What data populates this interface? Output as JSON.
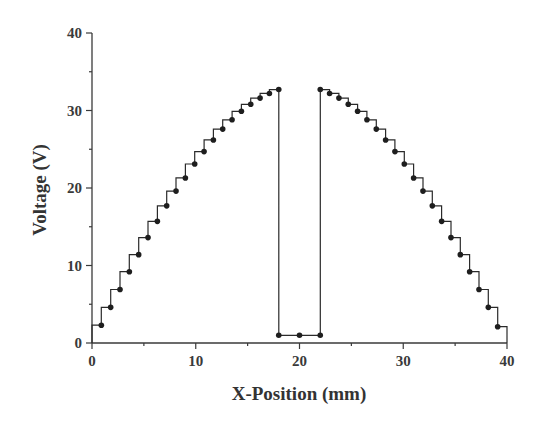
{
  "chart_data": {
    "type": "line",
    "style": "step with markers",
    "title": "",
    "xlabel": "X-Position (mm)",
    "ylabel": "Voltage (V)",
    "xlim": [
      0,
      40
    ],
    "ylim": [
      0,
      40
    ],
    "xticks": [
      0,
      10,
      20,
      30,
      40
    ],
    "yticks": [
      0,
      10,
      20,
      30,
      40
    ],
    "minor_tick_step": 5,
    "grid": false,
    "legend": null,
    "colors": {
      "line": "#2a2a2a",
      "marker": "#1e1e1e",
      "axis": "#3a3a3a"
    },
    "series": [
      {
        "name": "left segment",
        "step": "pre",
        "start": [
          0,
          2.3
        ],
        "x": [
          0.9,
          1.8,
          2.7,
          3.6,
          4.5,
          5.4,
          6.3,
          7.2,
          8.1,
          9.0,
          9.9,
          10.8,
          11.7,
          12.6,
          13.5,
          14.4,
          15.3,
          16.2,
          17.1,
          18.0
        ],
        "y": [
          2.3,
          4.6,
          6.9,
          9.2,
          11.4,
          13.6,
          15.7,
          17.7,
          19.6,
          21.3,
          23.1,
          24.7,
          26.2,
          27.6,
          28.8,
          29.9,
          30.8,
          31.6,
          32.2,
          32.7
        ]
      },
      {
        "name": "center gap",
        "step": "none",
        "x": [
          18.0,
          20.0,
          22.0
        ],
        "y": [
          1.0,
          1.0,
          1.0
        ]
      },
      {
        "name": "right segment",
        "step": "post",
        "end": [
          40,
          2.1
        ],
        "x": [
          22.0,
          22.9,
          23.8,
          24.7,
          25.6,
          26.5,
          27.4,
          28.3,
          29.2,
          30.1,
          31.0,
          31.9,
          32.8,
          33.7,
          34.6,
          35.5,
          36.4,
          37.3,
          38.2,
          39.1
        ],
        "y": [
          32.7,
          32.2,
          31.6,
          30.8,
          29.9,
          28.8,
          27.6,
          26.2,
          24.7,
          23.1,
          21.3,
          19.6,
          17.7,
          15.7,
          13.6,
          11.4,
          9.2,
          6.9,
          4.6,
          2.1
        ]
      }
    ]
  },
  "axes": {
    "x_title": "X-Position (mm)",
    "y_title": "Voltage (V)",
    "x_tick_labels": [
      "0",
      "10",
      "20",
      "30",
      "40"
    ],
    "y_tick_labels": [
      "0",
      "10",
      "20",
      "30",
      "40"
    ]
  }
}
